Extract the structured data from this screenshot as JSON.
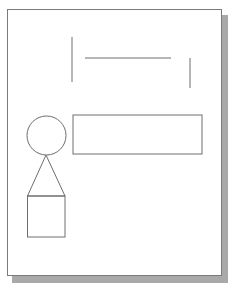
{
  "diagram": {
    "page": {
      "x": 7,
      "y": 9,
      "width": 215,
      "height": 267,
      "fill": "#ffffff",
      "border_color": "#7a7a7a",
      "shadow_color": "#a9a9a9",
      "shadow_offset": [
        5,
        6
      ]
    },
    "stroke_color": "#6e6e6e",
    "shapes": [
      {
        "id": "left-vertical-line",
        "type": "line",
        "x1": 72,
        "y1": 37,
        "x2": 72,
        "y2": 82
      },
      {
        "id": "top-horizontal-line",
        "type": "line",
        "x1": 85,
        "y1": 58,
        "x2": 171,
        "y2": 58
      },
      {
        "id": "right-vertical-line",
        "type": "line",
        "x1": 190,
        "y1": 58,
        "x2": 190,
        "y2": 88
      },
      {
        "id": "circle",
        "type": "circle",
        "cx": 46.5,
        "cy": 135.5,
        "r": 19.5
      },
      {
        "id": "wide-rectangle",
        "type": "rect",
        "x": 73,
        "y": 115,
        "width": 129,
        "height": 39
      },
      {
        "id": "triangle",
        "type": "polygon",
        "points": "46,155 27.5,196 65,196"
      },
      {
        "id": "square",
        "type": "rect",
        "x": 27.5,
        "y": 196,
        "width": 37.5,
        "height": 41
      }
    ]
  }
}
